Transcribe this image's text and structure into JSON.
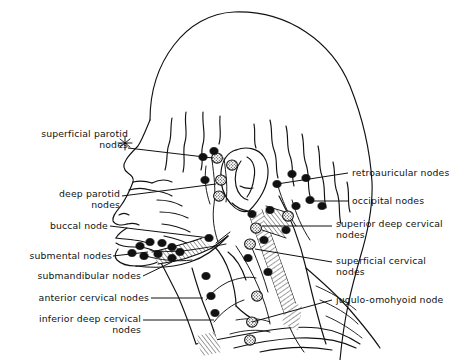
{
  "figure": {
    "type": "anatomical-line-diagram",
    "view": "right lateral profile of head and neck",
    "background_color": "#ffffff",
    "ink_color": "#000000",
    "width": 459,
    "height": 360
  },
  "labels": {
    "left": [
      {
        "id": "superficial-parotid-nodes",
        "text": "superficial parotid\nnodes",
        "lines": [
          "superficial parotid",
          "nodes"
        ],
        "align": "right",
        "x": 10,
        "y": 128,
        "leader_from": [
          128,
          148
        ],
        "leader_to": [
          213,
          158
        ]
      },
      {
        "id": "deep-parotid-nodes",
        "text": "deep parotid\nnodes",
        "lines": [
          "deep parotid",
          "nodes"
        ],
        "align": "right",
        "x": 36,
        "y": 188,
        "leader_from": [
          122,
          196
        ],
        "leader_to": [
          216,
          184
        ]
      },
      {
        "id": "buccal-node",
        "text": "buccal node",
        "lines": [
          "buccal node"
        ],
        "align": "right",
        "x": 38,
        "y": 222,
        "leader_from": [
          110,
          226
        ],
        "leader_to": [
          210,
          238
        ]
      },
      {
        "id": "submental-nodes",
        "text": "submental nodes",
        "lines": [
          "submental nodes"
        ],
        "align": "right",
        "x": 14,
        "y": 252,
        "leader_from": [
          113,
          256
        ],
        "leader_to": [
          148,
          252
        ]
      },
      {
        "id": "submandibular-nodes",
        "text": "submandibular nodes",
        "lines": [
          "submandibular nodes"
        ],
        "align": "right",
        "x": 14,
        "y": 273,
        "leader_from": [
          143,
          276
        ],
        "leader_to": [
          172,
          262
        ]
      },
      {
        "id": "anterior-cervical-nodes",
        "text": "anterior cervical nodes",
        "lines": [
          "anterior cervical nodes"
        ],
        "align": "right",
        "x": 14,
        "y": 294,
        "leader_from": [
          151,
          298
        ],
        "leader_to": [
          203,
          298
        ]
      },
      {
        "id": "inferior-deep-cervical-nodes",
        "text": "inferior deep cervical\nnodes",
        "lines": [
          "inferior deep cervical",
          "nodes"
        ],
        "align": "right",
        "x": 18,
        "y": 315,
        "leader_from": [
          143,
          320
        ],
        "leader_to": [
          214,
          320
        ]
      }
    ],
    "right": [
      {
        "id": "retroauricular-nodes",
        "text": "retroauricular nodes",
        "lines": [
          "retroauricular nodes"
        ],
        "align": "left",
        "x": 352,
        "y": 168,
        "leader_from": [
          348,
          173
        ],
        "leader_to": [
          277,
          184
        ]
      },
      {
        "id": "occipital-nodes",
        "text": "occipital nodes",
        "lines": [
          "occipital nodes"
        ],
        "align": "left",
        "x": 352,
        "y": 196,
        "leader_from": [
          348,
          201
        ],
        "leader_to": [
          306,
          201
        ]
      },
      {
        "id": "superior-deep-cervical-nodes",
        "text": "superior deep cervical\nnodes",
        "lines": [
          "superior deep cervical",
          "nodes"
        ],
        "align": "left",
        "x": 336,
        "y": 219,
        "leader_from": [
          332,
          226
        ],
        "leader_to": [
          262,
          226
        ]
      },
      {
        "id": "superficial-cervical-nodes",
        "text": "superficial cervical\nnodes",
        "lines": [
          "superficial cervical",
          "nodes"
        ],
        "align": "left",
        "x": 336,
        "y": 256,
        "leader_from": [
          332,
          262
        ],
        "leader_to": [
          255,
          249
        ]
      },
      {
        "id": "jugulo-omohyoid-node",
        "text": "jugulo-omohyoid node",
        "lines": [
          "jugulo-omohyoid node"
        ],
        "align": "left",
        "x": 336,
        "y": 295,
        "leader_from": [
          332,
          300
        ],
        "leader_to": [
          252,
          322
        ]
      }
    ]
  },
  "node_groups": [
    {
      "name": "superficial parotid nodes",
      "style": "stippled-circle",
      "count": 3
    },
    {
      "name": "deep parotid nodes",
      "style": "stippled-circle",
      "count": 2
    },
    {
      "name": "buccal node",
      "style": "solid-black",
      "count": 1
    },
    {
      "name": "submental nodes",
      "style": "solid-black",
      "count": 4
    },
    {
      "name": "submandibular nodes",
      "style": "solid-black",
      "count": 5
    },
    {
      "name": "anterior cervical nodes",
      "style": "solid-black",
      "count": 3
    },
    {
      "name": "inferior deep cervical nodes",
      "style": "stippled-circle",
      "count": 2
    },
    {
      "name": "retroauricular nodes",
      "style": "solid-black",
      "count": 3
    },
    {
      "name": "occipital nodes",
      "style": "solid-black",
      "count": 3
    },
    {
      "name": "superior deep cervical nodes",
      "style": "stippled-circle",
      "count": 2
    },
    {
      "name": "superficial cervical nodes",
      "style": "solid-black",
      "count": 3
    },
    {
      "name": "jugulo-omohyoid node",
      "style": "stippled-circle",
      "count": 1
    }
  ]
}
